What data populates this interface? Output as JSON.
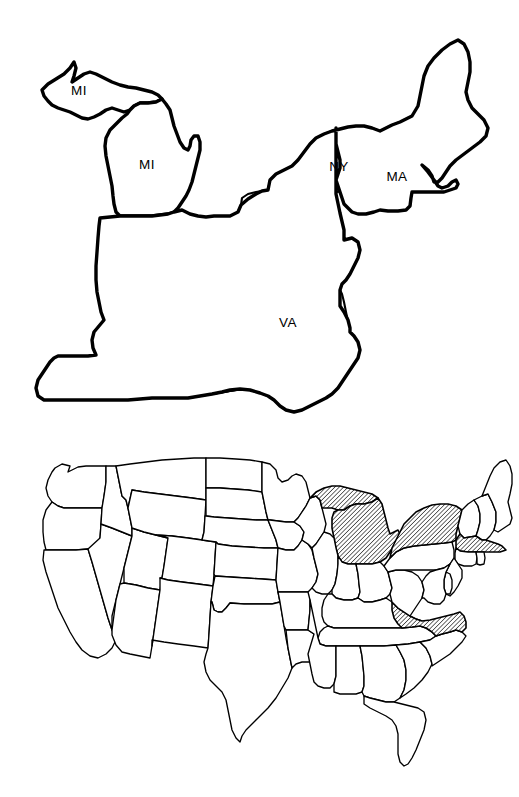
{
  "figure": {
    "background_color": "#ffffff",
    "ink_color": "#000000",
    "panel_count": 2
  },
  "regional_map": {
    "name": "northeastern-and-midwestern-united-states-outline-map",
    "description": "Thick black outline map of the northeastern and east-central United States with selected states labeled",
    "line_color": "#000000",
    "fill_color": "#ffffff",
    "labels": [
      {
        "id": "mi-upper",
        "text": "MI",
        "state": "Michigan Upper Peninsula",
        "x": 79,
        "y": 91
      },
      {
        "id": "mi-lower",
        "text": "MI",
        "state": "Michigan Lower Peninsula",
        "x": 147,
        "y": 165
      },
      {
        "id": "ny",
        "text": "NY",
        "state": "New York",
        "x": 339,
        "y": 167
      },
      {
        "id": "ma",
        "text": "MA",
        "state": "Massachusetts",
        "x": 397,
        "y": 177
      },
      {
        "id": "va",
        "text": "VA",
        "state": "Virginia",
        "x": 288,
        "y": 323
      }
    ]
  },
  "national_map": {
    "name": "continental-united-states-choropleth-map",
    "description": "Thin black outline map of the continental United States with four states filled with diagonal hatching",
    "line_color": "#000000",
    "fill_color": "#ffffff",
    "hatch": {
      "pattern": "diagonal-lines",
      "angle_degrees": 45,
      "spacing_px": 3.1,
      "stroke_width_px": 1.15,
      "color": "#000000"
    },
    "highlighted_states": [
      {
        "code": "MI",
        "name": "Michigan",
        "highlighted": true
      },
      {
        "code": "NY",
        "name": "New York",
        "highlighted": true
      },
      {
        "code": "MA",
        "name": "Massachusetts",
        "highlighted": true
      },
      {
        "code": "VA",
        "name": "Virginia",
        "highlighted": true
      }
    ],
    "unhighlighted_note": "all other states rendered as plain white outlines"
  },
  "chart_data": {
    "type": "map",
    "title": "",
    "subtitle": "",
    "categories": [
      "MI",
      "NY",
      "MA",
      "VA"
    ],
    "values": [
      1,
      1,
      1,
      1
    ],
    "legend": [],
    "annotations": [
      "MI",
      "MI",
      "NY",
      "MA",
      "VA"
    ]
  }
}
